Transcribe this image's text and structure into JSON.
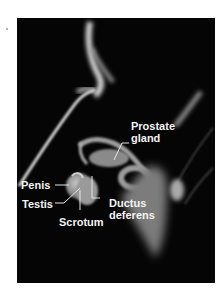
{
  "figure": {
    "background_color": "#050505",
    "label_color": "#f2f2f2",
    "labels": [
      {
        "id": "prostate",
        "line1": "Prostate",
        "line2": "gland"
      },
      {
        "id": "penis",
        "line1": "Penis"
      },
      {
        "id": "testis",
        "line1": "Testis"
      },
      {
        "id": "scrotum",
        "line1": "Scrotum"
      },
      {
        "id": "ductus",
        "line1": "Ductus",
        "line2": "deferens"
      }
    ]
  }
}
